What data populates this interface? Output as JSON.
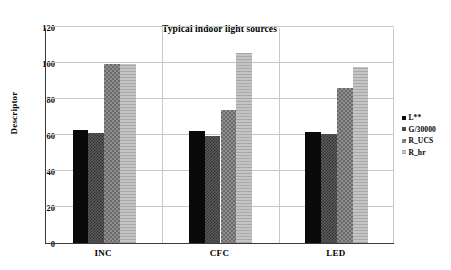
{
  "chart_data": {
    "type": "bar",
    "title": "Typical indoor light sources",
    "xlabel": "",
    "ylabel": "Descriptor",
    "categories": [
      "INC",
      "CFC",
      "LED"
    ],
    "series": [
      {
        "name": "L**",
        "values": [
          62.7,
          62.3,
          61.7
        ],
        "color": "#0a0a0a"
      },
      {
        "name": "G/30000",
        "values": [
          61.0,
          59.2,
          60.8
        ],
        "color": "#5d5d5d"
      },
      {
        "name": "R_UCS",
        "values": [
          99.6,
          74.1,
          86.3
        ],
        "color": "#8f8f8f"
      },
      {
        "name": "R_hr",
        "values": [
          99.6,
          105.7,
          97.6
        ],
        "color": "#b4b4b4"
      }
    ],
    "ylim": [
      0,
      120
    ],
    "yticks": [
      0,
      20,
      40,
      60,
      80,
      100,
      120
    ],
    "grid": "horizontal-and-vertical",
    "legend_position": "right"
  }
}
